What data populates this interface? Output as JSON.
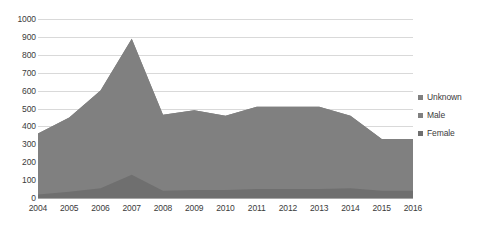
{
  "chart_data": {
    "type": "area",
    "stacked": true,
    "title": "",
    "subtitle": "",
    "xlabel": "",
    "ylabel": "",
    "categories": [
      "2004",
      "2005",
      "2006",
      "2007",
      "2008",
      "2009",
      "2010",
      "2011",
      "2012",
      "2013",
      "2014",
      "2015",
      "2016"
    ],
    "series": [
      {
        "name": "Female",
        "color": "#6f6f6f",
        "values": [
          20,
          35,
          55,
          130,
          40,
          45,
          45,
          50,
          50,
          50,
          55,
          40,
          40
        ]
      },
      {
        "name": "Male",
        "color": "#808080",
        "values": [
          340,
          415,
          545,
          760,
          425,
          445,
          415,
          460,
          460,
          460,
          405,
          290,
          290
        ]
      },
      {
        "name": "Unknown",
        "color": "#808080",
        "values": [
          0,
          0,
          0,
          0,
          0,
          0,
          0,
          0,
          0,
          0,
          0,
          0,
          0
        ]
      }
    ],
    "totals": [
      360,
      450,
      600,
      890,
      465,
      490,
      460,
      510,
      510,
      510,
      460,
      330,
      330
    ],
    "ylim": [
      0,
      1000
    ],
    "yticks": [
      "1000",
      "900",
      "800",
      "700",
      "600",
      "500",
      "400",
      "300",
      "200",
      "100",
      "0"
    ],
    "ytick_values": [
      1000,
      900,
      800,
      700,
      600,
      500,
      400,
      300,
      200,
      100,
      0
    ],
    "grid": true,
    "legend_position": "right",
    "legend": [
      {
        "label": "Unknown",
        "color": "#808080"
      },
      {
        "label": "Male",
        "color": "#808080"
      },
      {
        "label": "Female",
        "color": "#6f6f6f"
      }
    ]
  },
  "colors": {
    "gridline": "#d9d9d9",
    "axis": "#a6a6a6",
    "text": "#3b3b3b",
    "background": "#ffffff"
  }
}
